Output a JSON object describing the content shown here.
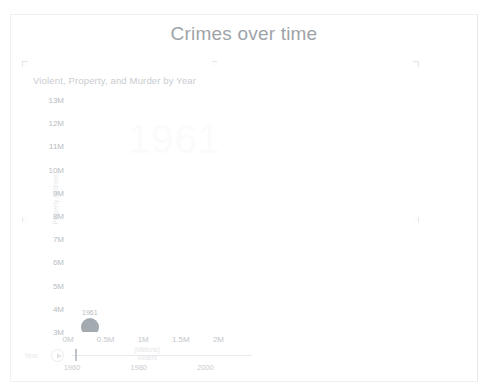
{
  "page": {
    "title": "Crimes over time"
  },
  "visual": {
    "title": "Violent, Property, and Murder by Year",
    "watermark_year": "1961"
  },
  "chart_data": {
    "type": "scatter",
    "title": "Violent, Property, and Murder by Year",
    "xlabel_line1": "(Millions)",
    "xlabel_line2": "Violent",
    "ylabel_line1": "Property",
    "ylabel_line2": "(Millions)",
    "xlim": [
      0,
      2.1
    ],
    "ylim": [
      3,
      13
    ],
    "x_unit": "millions",
    "y_unit": "millions",
    "grid": false,
    "legend": "none",
    "x_ticks": [
      "0M",
      "0.5M",
      "1M",
      "1.5M",
      "2M"
    ],
    "x_tick_values": [
      0,
      0.5,
      1,
      1.5,
      2
    ],
    "y_ticks": [
      "13M",
      "12M",
      "11M",
      "10M",
      "9M",
      "8M",
      "7M",
      "6M",
      "5M",
      "4M",
      "3M"
    ],
    "y_tick_values": [
      13,
      12,
      11,
      10,
      9,
      8,
      7,
      6,
      5,
      4,
      3
    ],
    "animation_frame": "1961",
    "points": [
      {
        "label": "1961",
        "x": 0.29,
        "y": 3.2,
        "size": 9,
        "color": "#9ba3a9"
      }
    ]
  },
  "slider": {
    "label": "Year",
    "play_icon": "play-icon",
    "value": "1961",
    "min": 1960,
    "max": 2014,
    "ticks": [
      "1960",
      "1980",
      "2000"
    ],
    "tick_values": [
      1960,
      1980,
      2000
    ]
  },
  "colors": {
    "title": "#9ea3a8",
    "axis_text": "#b9bdc2",
    "bubble": "#9ba3a9",
    "page_border": "#f0f1f2"
  }
}
